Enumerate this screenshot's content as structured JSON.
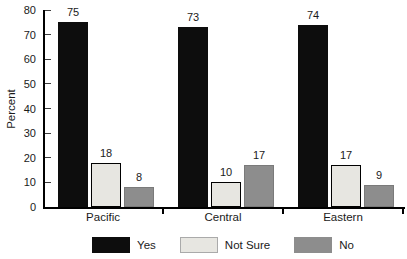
{
  "chart_data": {
    "type": "bar",
    "title": "",
    "xlabel": "",
    "ylabel": "Percent",
    "categories": [
      "Pacific",
      "Central",
      "Eastern"
    ],
    "series": [
      {
        "name": "Yes",
        "color": "#0d0d0d",
        "border": "#0d0d0d",
        "values": [
          75,
          73,
          74
        ]
      },
      {
        "name": "Not Sure",
        "color": "#e7e6e1",
        "border": "#000000",
        "values": [
          18,
          10,
          17
        ]
      },
      {
        "name": "No",
        "color": "#8d8d8d",
        "border": "#7a7a7a",
        "values": [
          8,
          17,
          9
        ]
      }
    ],
    "ylim": [
      0,
      80
    ],
    "ytick_step": 10,
    "ytick_labels": [
      "0",
      "10",
      "20",
      "30",
      "40",
      "50",
      "60",
      "70",
      "80"
    ],
    "grid": false,
    "legend_position": "bottom",
    "bar_value_labels_shown": true
  },
  "colors": {
    "background": "#ffffff",
    "axis": "#000000",
    "tick": "#3c3c3c",
    "text": "#1a1a1a"
  }
}
